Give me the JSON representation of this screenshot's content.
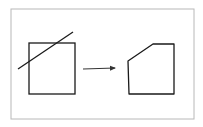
{
  "diagram": {
    "title": "",
    "colors": {
      "background": "#ffffff",
      "frame": "#b8b8b8",
      "stroke": "#1a1a1a",
      "arrow": "#333333"
    },
    "frame": {
      "x": 11,
      "y": 9,
      "width": 183,
      "height": 110
    },
    "before": {
      "label": "",
      "square": {
        "x": 29,
        "y": 43,
        "width": 46,
        "height": 51
      },
      "clip_line": {
        "x1": 18,
        "y1": 69,
        "x2": 73,
        "y2": 32
      }
    },
    "transition_arrow": {
      "x1": 83,
      "y1": 69,
      "x2": 115,
      "y2": 68
    },
    "after": {
      "label": "",
      "polygon_points": "128,61 153,44 174,44 174,94 129,94"
    }
  }
}
